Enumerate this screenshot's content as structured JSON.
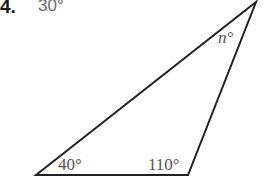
{
  "problem": {
    "number": "4.",
    "answer": "30°"
  },
  "triangle": {
    "vertices": {
      "bottom_left": [
        36,
        175
      ],
      "bottom_right": [
        188,
        175
      ],
      "top": [
        256,
        2
      ]
    },
    "stroke_color": "#222222",
    "label_color": "#555555",
    "angles": {
      "bottom_left": "40°",
      "bottom_right": "110°",
      "top": "n°"
    }
  }
}
